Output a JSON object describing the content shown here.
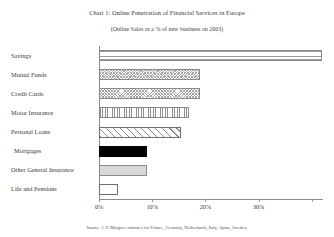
{
  "chart_data": {
    "type": "bar",
    "orientation": "horizontal",
    "title": "Chart 1: Online Penetration of Financial Services in Europe",
    "subtitle": "(Online Sales as a % of new business on 2003)",
    "source": "Source: J. P. Morgan estimates for France, Germany, Netherlands, Italy, Spain, Sweden.",
    "xlabel": "",
    "ylabel": "",
    "xlim": [
      0,
      42
    ],
    "grid": false,
    "legend": "none",
    "tick_labels": [
      "0%",
      "10%",
      "20%",
      "30%"
    ],
    "tick_values": [
      0,
      10,
      20,
      30
    ],
    "categories": [
      "Savings",
      "Mutual Funds",
      "Credit Cards",
      "Motor Insurance",
      "Personal Loans",
      "Mortgages",
      "Other General Insurance",
      "Life and Pensions"
    ],
    "values": [
      42,
      19,
      19,
      17,
      15.5,
      9,
      9,
      3.5
    ],
    "bars": [
      {
        "label": "Savings",
        "value": 42,
        "pattern": "horizontal-lines"
      },
      {
        "label": "Mutual Funds",
        "value": 19,
        "pattern": "checker"
      },
      {
        "label": "Credit Cards",
        "value": 19,
        "pattern": "cross-hatch"
      },
      {
        "label": "Motor Insurance",
        "value": 17,
        "pattern": "vertical-lines"
      },
      {
        "label": "Personal Loans",
        "value": 15.5,
        "pattern": "diagonal-hatch"
      },
      {
        "label": "Mortgages",
        "value": 9,
        "pattern": "solid-black"
      },
      {
        "label": "Other General Insurance",
        "value": 9,
        "pattern": "light-gray"
      },
      {
        "label": "Life and Pensions",
        "value": 3.5,
        "pattern": "white-outline"
      }
    ]
  },
  "colors": {
    "axis": "#8c8c8c",
    "text": "#3a3a3a",
    "bar_outline": "#8a8a8a",
    "solid_black": "#000000",
    "light_gray": "#d8d8d8",
    "background": "#ffffff"
  }
}
